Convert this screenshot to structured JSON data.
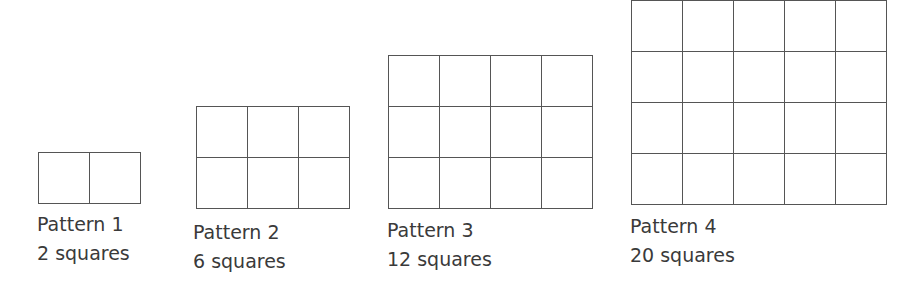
{
  "patterns": [
    {
      "name": "Pattern 1",
      "count": "2 squares",
      "rows": 1,
      "cols": 2,
      "x": 38,
      "y": 152,
      "label_x": 37,
      "label_y": 210
    },
    {
      "name": "Pattern 2",
      "count": "6 squares",
      "rows": 2,
      "cols": 3,
      "x": 196,
      "y": 106,
      "label_x": 193,
      "label_y": 218
    },
    {
      "name": "Pattern 3",
      "count": "12 squares",
      "rows": 3,
      "cols": 4,
      "x": 388,
      "y": 55,
      "label_x": 387,
      "label_y": 216
    },
    {
      "name": "Pattern 4",
      "count": "20 squares",
      "rows": 4,
      "cols": 5,
      "x": 631,
      "y": 0,
      "label_x": 630,
      "label_y": 212
    }
  ],
  "cell_size": 51,
  "line_color": "#555555"
}
